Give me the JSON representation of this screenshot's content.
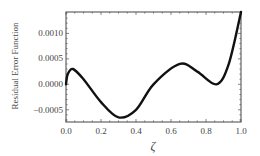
{
  "chart_data": {
    "type": "line",
    "title": "",
    "xlabel": "ζ",
    "ylabel": "Residual Error Function",
    "xlim": [
      0.0,
      1.0
    ],
    "ylim": [
      -0.00074,
      0.00142
    ],
    "grid": false,
    "legend": null,
    "x_ticks": [
      "0.0",
      "0.2",
      "0.4",
      "0.6",
      "0.8",
      "1.0"
    ],
    "y_ticks": [
      "0.0010",
      "0.0005",
      "0.0000",
      "-0.0005"
    ],
    "series": [
      {
        "name": "Residual Error Function",
        "color": "#111111",
        "x": [
          0.0,
          0.01,
          0.04,
          0.1,
          0.2,
          0.3,
          0.4,
          0.5,
          0.65,
          0.75,
          0.86,
          0.93,
          1.0
        ],
        "y": [
          0.0,
          0.0002,
          0.0003,
          0.0001,
          -0.00035,
          -0.00065,
          -0.0005,
          0.0,
          0.0004,
          0.00025,
          0.0,
          0.0004,
          0.00142
        ]
      }
    ]
  },
  "labels": {
    "ylabel": "Residual Error Function",
    "xlabel": "ζ",
    "x_ticks": [
      "0.0",
      "0.2",
      "0.4",
      "0.6",
      "0.8",
      "1.0"
    ],
    "y_ticks": [
      "0.0010",
      "0.0005",
      "0.0000",
      "−0.0005"
    ]
  }
}
